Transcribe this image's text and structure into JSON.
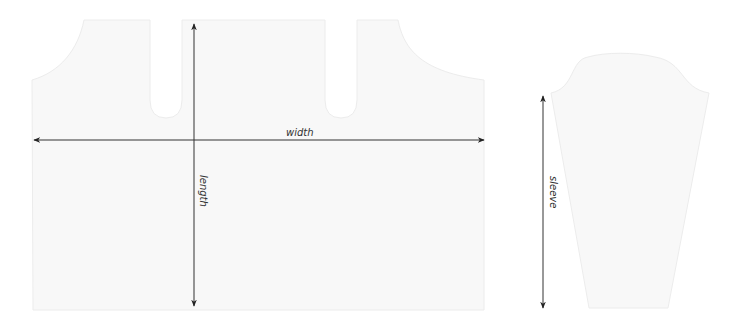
{
  "diagram": {
    "type": "sewing-pattern-schematic",
    "pieces": [
      {
        "id": "body",
        "name": "Body piece"
      },
      {
        "id": "sleeve",
        "name": "Sleeve piece"
      }
    ],
    "measurements": {
      "width": "width",
      "length": "length",
      "sleeve": "sleeve"
    },
    "colors": {
      "piece_fill": "#f8f8f8",
      "piece_edge": "#ececec",
      "arrow": "#222222",
      "label": "#333333"
    }
  }
}
